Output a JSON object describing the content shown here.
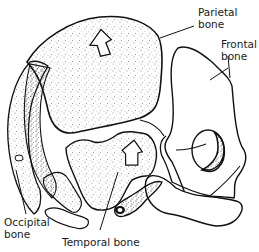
{
  "diagram": {
    "labels": {
      "parietal": {
        "line1": "Parietal",
        "line2": "bone"
      },
      "frontal": {
        "line1": "Frontal",
        "line2": "bone"
      },
      "occipital": {
        "line1": "Occipital",
        "line2": "bone"
      },
      "temporal": {
        "line1": "Temporal bone"
      }
    },
    "colors": {
      "ink": "#111111",
      "background": "#ffffff"
    }
  }
}
